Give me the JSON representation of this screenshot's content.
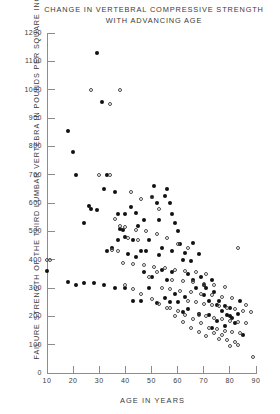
{
  "chart_data": {
    "type": "scatter",
    "title": "CHANGE IN VERTEBRAL COMPRESSIVE STRENGTH WITH ADVANCING AGE",
    "title_line1": "CHANGE IN VERTEBRAL COMPRESSIVE STRENGTH",
    "title_line2": "WITH ADVANCING AGE",
    "xlabel": "AGE IN YEARS",
    "ylabel": "FAILURE STRENGTH OF THE THIRD LUMBAR VERTEBRA IN POUNDS PER SQUARE INCH",
    "xlim": [
      10,
      90
    ],
    "ylim": [
      0,
      1200
    ],
    "xticks": [
      10,
      20,
      30,
      40,
      50,
      60,
      70,
      80,
      90
    ],
    "ytick_labels": [
      "0",
      "100",
      "200",
      "300",
      "400",
      "500",
      "600",
      "700",
      "800",
      "900",
      "1000",
      "1100",
      "1200"
    ],
    "yticks": [
      0,
      100,
      200,
      300,
      400,
      500,
      600,
      700,
      800,
      900,
      1000,
      1100,
      1200
    ],
    "grid": false,
    "legend": null,
    "marker_colors": {
      "filled": "#111111",
      "open": "#4a4a4a",
      "axis": "#8d8d8d"
    },
    "series": [
      {
        "name": "filled",
        "marker": "filled-circle",
        "points": [
          [
            10,
            360
          ],
          [
            18,
            855
          ],
          [
            20,
            780
          ],
          [
            21,
            700
          ],
          [
            29,
            1130
          ],
          [
            31,
            955
          ],
          [
            32,
            650
          ],
          [
            33,
            700
          ],
          [
            26,
            590
          ],
          [
            27,
            580
          ],
          [
            29,
            575
          ],
          [
            24,
            530
          ],
          [
            36,
            640
          ],
          [
            37,
            560
          ],
          [
            38,
            510
          ],
          [
            40,
            560
          ],
          [
            42,
            585
          ],
          [
            40,
            480
          ],
          [
            43,
            470
          ],
          [
            44,
            565
          ],
          [
            45,
            520
          ],
          [
            47,
            540
          ],
          [
            46,
            430
          ],
          [
            48,
            430
          ],
          [
            49,
            470
          ],
          [
            50,
            620
          ],
          [
            51,
            660
          ],
          [
            52,
            600
          ],
          [
            53,
            540
          ],
          [
            54,
            440
          ],
          [
            53,
            418
          ],
          [
            55,
            625
          ],
          [
            56,
            648
          ],
          [
            57,
            600
          ],
          [
            58,
            560
          ],
          [
            59,
            530
          ],
          [
            60,
            500
          ],
          [
            58,
            430
          ],
          [
            61,
            455
          ],
          [
            62,
            400
          ],
          [
            63,
            425
          ],
          [
            64,
            350
          ],
          [
            65,
            395
          ],
          [
            66,
            330
          ],
          [
            67,
            300
          ],
          [
            68,
            420
          ],
          [
            69,
            340
          ],
          [
            70,
            310
          ],
          [
            70,
            275
          ],
          [
            71,
            300
          ],
          [
            72,
            255
          ],
          [
            73,
            330
          ],
          [
            74,
            285
          ],
          [
            75,
            240
          ],
          [
            76,
            255
          ],
          [
            77,
            220
          ],
          [
            78,
            235
          ],
          [
            79,
            205
          ],
          [
            80,
            230
          ],
          [
            81,
            195
          ],
          [
            82,
            175
          ],
          [
            83,
            210
          ],
          [
            84,
            255
          ],
          [
            85,
            135
          ],
          [
            66,
            460
          ],
          [
            63,
            270
          ],
          [
            59,
            280
          ],
          [
            57,
            250
          ],
          [
            55,
            265
          ],
          [
            52,
            248
          ],
          [
            49,
            300
          ],
          [
            46,
            255
          ],
          [
            43,
            255
          ],
          [
            40,
            300
          ],
          [
            36,
            300
          ],
          [
            32,
            310
          ],
          [
            28,
            318
          ],
          [
            24,
            318
          ],
          [
            21,
            310
          ],
          [
            18,
            320
          ],
          [
            33,
            430
          ],
          [
            35,
            440
          ],
          [
            37,
            470
          ],
          [
            39,
            505
          ],
          [
            41,
            420
          ],
          [
            44,
            408
          ],
          [
            47,
            355
          ],
          [
            50,
            340
          ],
          [
            54,
            362
          ],
          [
            56,
            330
          ],
          [
            58,
            355
          ],
          [
            60,
            250
          ],
          [
            62,
            215
          ],
          [
            64,
            225
          ],
          [
            68,
            210
          ],
          [
            72,
            205
          ],
          [
            75,
            185
          ],
          [
            78,
            165
          ],
          [
            80,
            200
          ],
          [
            73,
            160
          ]
        ]
      },
      {
        "name": "open",
        "marker": "open-circle",
        "points": [
          [
            10,
            398
          ],
          [
            11,
            398
          ],
          [
            27,
            1000
          ],
          [
            38,
            1000
          ],
          [
            34,
            950
          ],
          [
            30,
            700
          ],
          [
            34,
            700
          ],
          [
            42,
            640
          ],
          [
            46,
            615
          ],
          [
            50,
            620
          ],
          [
            53,
            580
          ],
          [
            36,
            545
          ],
          [
            38,
            520
          ],
          [
            40,
            515
          ],
          [
            44,
            505
          ],
          [
            48,
            500
          ],
          [
            41,
            475
          ],
          [
            45,
            470
          ],
          [
            52,
            490
          ],
          [
            56,
            475
          ],
          [
            35,
            435
          ],
          [
            37,
            430
          ],
          [
            60,
            455
          ],
          [
            64,
            440
          ],
          [
            83,
            440
          ],
          [
            39,
            390
          ],
          [
            43,
            385
          ],
          [
            47,
            380
          ],
          [
            51,
            375
          ],
          [
            55,
            370
          ],
          [
            59,
            365
          ],
          [
            63,
            360
          ],
          [
            67,
            355
          ],
          [
            71,
            350
          ],
          [
            58,
            330
          ],
          [
            62,
            325
          ],
          [
            66,
            320
          ],
          [
            70,
            315
          ],
          [
            74,
            310
          ],
          [
            78,
            305
          ],
          [
            54,
            300
          ],
          [
            57,
            295
          ],
          [
            61,
            290
          ],
          [
            65,
            285
          ],
          [
            69,
            280
          ],
          [
            73,
            275
          ],
          [
            77,
            270
          ],
          [
            81,
            265
          ],
          [
            64,
            255
          ],
          [
            67,
            250
          ],
          [
            70,
            245
          ],
          [
            73,
            240
          ],
          [
            76,
            235
          ],
          [
            79,
            230
          ],
          [
            82,
            225
          ],
          [
            85,
            220
          ],
          [
            68,
            205
          ],
          [
            71,
            200
          ],
          [
            74,
            195
          ],
          [
            77,
            190
          ],
          [
            80,
            185
          ],
          [
            83,
            180
          ],
          [
            86,
            175
          ],
          [
            72,
            160
          ],
          [
            75,
            155
          ],
          [
            78,
            150
          ],
          [
            81,
            145
          ],
          [
            84,
            140
          ],
          [
            76,
            120
          ],
          [
            79,
            115
          ],
          [
            82,
            110
          ],
          [
            89,
            55
          ],
          [
            69,
            175
          ],
          [
            66,
            190
          ],
          [
            63,
            205
          ],
          [
            60,
            220
          ],
          [
            57,
            230
          ],
          [
            53,
            245
          ],
          [
            50,
            260
          ],
          [
            46,
            280
          ],
          [
            43,
            295
          ],
          [
            40,
            310
          ],
          [
            49,
            340
          ],
          [
            52,
            355
          ],
          [
            56,
            230
          ],
          [
            59,
            200
          ],
          [
            62,
            180
          ],
          [
            65,
            160
          ],
          [
            68,
            145
          ],
          [
            71,
            130
          ],
          [
            74,
            140
          ],
          [
            77,
            135
          ],
          [
            80,
            95
          ],
          [
            83,
            100
          ],
          [
            86,
            240
          ],
          [
            88,
            215
          ]
        ]
      }
    ]
  }
}
